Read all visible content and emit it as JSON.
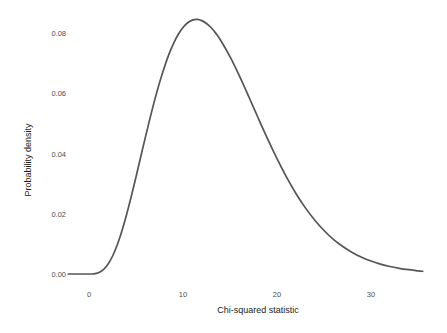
{
  "chart_data": {
    "type": "line",
    "title": "",
    "subtitle": "",
    "xlabel": "Chi-squared statistic",
    "ylabel": "Probability density",
    "xlim": [
      -2.2,
      35.5
    ],
    "ylim": [
      -0.0012,
      0.0875
    ],
    "xticks": [
      0,
      10,
      20,
      30
    ],
    "xtick_labels": [
      "0",
      "10",
      "20",
      "30"
    ],
    "yticks": [
      0.0,
      0.02,
      0.04,
      0.06,
      0.08
    ],
    "ytick_labels": [
      "0.00",
      "0.02",
      "0.04",
      "0.06",
      "0.08"
    ],
    "grid": false,
    "legend": "none",
    "series": [
      {
        "name": "Chi-squared density (df = 12)",
        "color": "#555555",
        "x": [
          -2.2,
          -1.0,
          0.0,
          0.5,
          1.0,
          1.5,
          2.0,
          2.5,
          3.0,
          3.5,
          4.0,
          4.5,
          5.0,
          5.5,
          6.0,
          6.5,
          7.0,
          7.5,
          8.0,
          8.5,
          9.0,
          9.5,
          10.0,
          10.5,
          11.0,
          11.5,
          12.0,
          12.5,
          13.0,
          13.5,
          14.0,
          15.0,
          16.0,
          17.0,
          18.0,
          19.0,
          20.0,
          21.0,
          22.0,
          23.0,
          24.0,
          25.0,
          26.0,
          27.0,
          28.0,
          29.0,
          30.0,
          31.0,
          32.0,
          33.0,
          34.0,
          35.0,
          35.5
        ],
        "y": [
          0.0,
          0.0,
          0.0,
          2e-05,
          0.00013,
          0.00042,
          0.00095,
          0.00177,
          0.00289,
          0.00429,
          0.00593,
          0.00775,
          0.00968,
          0.01167,
          0.01365,
          0.01557,
          0.01739,
          0.01907,
          0.02058,
          0.0219,
          0.02301,
          0.02391,
          0.02459,
          0.02506,
          0.02532,
          0.02539,
          0.02527,
          0.02499,
          0.02456,
          0.024,
          0.02332,
          0.02168,
          0.01976,
          0.01768,
          0.01556,
          0.01348,
          0.01151,
          0.00969,
          0.00806,
          0.00662,
          0.00539,
          0.00434,
          0.00346,
          0.00274,
          0.00215,
          0.00167,
          0.00129,
          0.00099,
          0.00075,
          0.00057,
          0.00043,
          0.00032,
          0.00027
        ]
      }
    ],
    "peak": {
      "x": 10.7,
      "y": 0.0845
    },
    "note_density_scale": "displayed densities are scaled so the mode reads 0.0845 on the axis"
  },
  "axes": {
    "y_label": "Probability density",
    "x_label": "Chi-squared statistic"
  }
}
